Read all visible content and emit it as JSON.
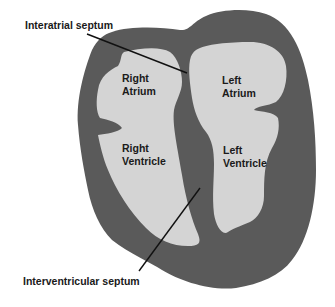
{
  "diagram": {
    "colors": {
      "background": "#ffffff",
      "wall": "#5a5a5a",
      "chamber": "#d4d4d4",
      "text": "#1a1a1a",
      "leader_line": "#111111"
    },
    "labels": {
      "interatrial_septum": "Interatrial septum",
      "interventricular_septum": "Interventricular septum"
    },
    "chambers": {
      "right_atrium": {
        "line1": "Right",
        "line2": "Atrium"
      },
      "left_atrium": {
        "line1": "Left",
        "line2": "Atrium"
      },
      "right_ventricle": {
        "line1": "Right",
        "line2": "Ventricle"
      },
      "left_ventricle": {
        "line1": "Left",
        "line2": "Ventricle"
      }
    }
  }
}
